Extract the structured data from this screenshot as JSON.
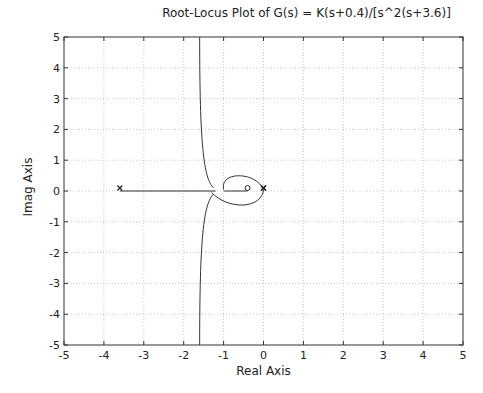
{
  "chart_data": {
    "type": "line",
    "title": "Root-Locus Plot of G(s) = K(s+0.4)/[s^2(s+3.6)]",
    "xlabel": "Real Axis",
    "ylabel": "Imag Axis",
    "xlim": [
      -5,
      5
    ],
    "ylim": [
      -5,
      5
    ],
    "xticks": [
      -5,
      -4,
      -3,
      -2,
      -1,
      0,
      1,
      2,
      3,
      4,
      5
    ],
    "yticks": [
      -5,
      -4,
      -3,
      -2,
      -1,
      0,
      1,
      2,
      3,
      4,
      5
    ],
    "grid": true,
    "poles": [
      {
        "re": -3.6,
        "im": 0
      },
      {
        "re": 0,
        "im": 0
      },
      {
        "re": 0,
        "im": 0
      }
    ],
    "zeros": [
      {
        "re": -0.4,
        "im": 0
      }
    ],
    "series": [
      {
        "name": "real-axis segment",
        "points": [
          [
            -3.6,
            0
          ],
          [
            -1.2,
            0
          ]
        ]
      },
      {
        "name": "zero-segment",
        "points": [
          [
            -1.0,
            0
          ],
          [
            -0.4,
            0
          ]
        ]
      },
      {
        "name": "upper asymptote branch",
        "points": [
          [
            -1.2,
            0.1
          ],
          [
            -1.4,
            0.5
          ],
          [
            -1.5,
            1.5
          ],
          [
            -1.55,
            3
          ],
          [
            -1.6,
            5
          ]
        ]
      },
      {
        "name": "lower asymptote branch",
        "points": [
          [
            -1.2,
            -0.1
          ],
          [
            -1.4,
            -0.5
          ],
          [
            -1.5,
            -1.5
          ],
          [
            -1.55,
            -3
          ],
          [
            -1.6,
            -5
          ]
        ]
      },
      {
        "name": "loop",
        "points": [
          [
            0,
            0
          ],
          [
            -0.3,
            0.45
          ],
          [
            -0.7,
            0.4
          ],
          [
            -1.0,
            0.1
          ],
          [
            -0.7,
            -0.4
          ],
          [
            -0.3,
            -0.45
          ],
          [
            0,
            0
          ]
        ]
      }
    ]
  }
}
